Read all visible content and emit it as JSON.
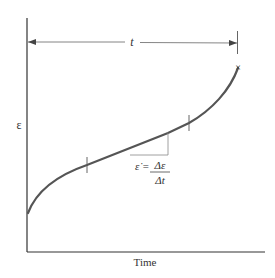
{
  "diagram": {
    "type": "creep-curve",
    "x_axis_label": "Time",
    "y_axis_label": "ε",
    "duration_label": "t",
    "rate_formula": {
      "lhs": "ε̇ =",
      "numerator": "Δε",
      "denominator": "Δt"
    },
    "end_marker": "×",
    "colors": {
      "curve": "#555555",
      "axis": "#333333",
      "annotation": "#777777",
      "text": "#333333"
    }
  }
}
